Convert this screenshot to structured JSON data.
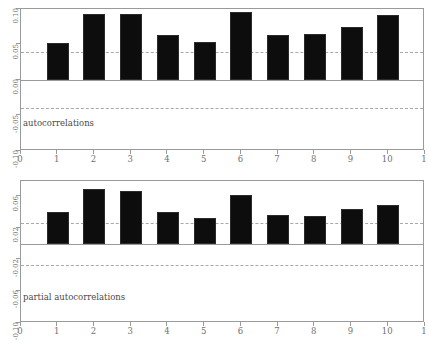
{
  "figure": {
    "background": "#ffffff",
    "bar_color": "#0d0d0d",
    "axis_color": "#9a9a9a",
    "conf_color": "#a8a8a8"
  },
  "chart_data": [
    {
      "type": "bar",
      "id": "autocorrelations",
      "title": "",
      "caption": "autocorrelations",
      "xlabel": "",
      "ylabel": "",
      "categories": [
        "1",
        "2",
        "3",
        "4",
        "5",
        "6",
        "7",
        "8",
        "9",
        "10"
      ],
      "x": [
        1,
        2,
        3,
        4,
        5,
        6,
        7,
        8,
        9,
        10
      ],
      "values": [
        0.052,
        0.093,
        0.093,
        0.064,
        0.053,
        0.096,
        0.064,
        0.065,
        0.075,
        0.091
      ],
      "xlim": [
        0,
        11
      ],
      "ylim": [
        -0.1,
        0.1
      ],
      "xticks": [
        "0",
        "1",
        "2",
        "3",
        "4",
        "5",
        "6",
        "7",
        "8",
        "9",
        "10",
        "1"
      ],
      "xtick_values": [
        0,
        1,
        2,
        3,
        4,
        5,
        6,
        7,
        8,
        9,
        10,
        11
      ],
      "yticks": [
        "0.10",
        "0.05",
        "0.00",
        "-0.05",
        "-0.10"
      ],
      "ytick_values": [
        0.1,
        0.05,
        0.0,
        -0.05,
        -0.1
      ],
      "zero_line": 0.0,
      "confidence_bounds": [
        0.04,
        -0.04
      ],
      "grid": false,
      "legend": "none"
    },
    {
      "type": "bar",
      "id": "partial-autocorrelations",
      "title": "",
      "caption": "partial autocorrelations",
      "xlabel": "",
      "ylabel": "",
      "categories": [
        "1",
        "2",
        "3",
        "4",
        "5",
        "6",
        "7",
        "8",
        "9",
        "10"
      ],
      "x": [
        1,
        2,
        3,
        4,
        5,
        6,
        7,
        8,
        9,
        10
      ],
      "values": [
        0.041,
        0.07,
        0.067,
        0.041,
        0.033,
        0.062,
        0.037,
        0.036,
        0.044,
        0.05
      ],
      "xlim": [
        0,
        11
      ],
      "ylim": [
        -0.1,
        0.08
      ],
      "xticks": [
        "0",
        "1",
        "2",
        "3",
        "4",
        "5",
        "6",
        "7",
        "8",
        "9",
        "10",
        "1"
      ],
      "xtick_values": [
        0,
        1,
        2,
        3,
        4,
        5,
        6,
        7,
        8,
        9,
        10,
        11
      ],
      "yticks": [
        "0.06",
        "0.02",
        "-0.02",
        "-0.06",
        "-0.10"
      ],
      "ytick_values": [
        0.06,
        0.02,
        -0.02,
        -0.06,
        -0.1
      ],
      "zero_line": 0.0,
      "confidence_bounds": [
        0.027,
        -0.027
      ],
      "grid": false,
      "legend": "none"
    }
  ]
}
